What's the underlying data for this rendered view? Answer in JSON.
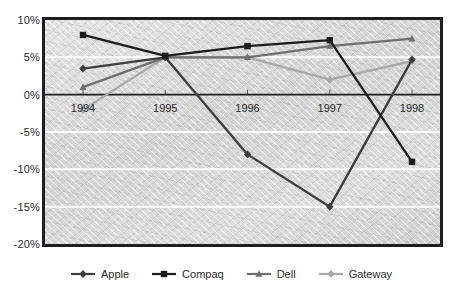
{
  "chart_data": {
    "type": "line",
    "title": "",
    "subtitle": "",
    "xlabel": "",
    "ylabel": "",
    "categories": [
      "1994",
      "1995",
      "1996",
      "1997",
      "1998"
    ],
    "ylim": [
      -20,
      10
    ],
    "ytick_labels": [
      "10%",
      "5%",
      "0%",
      "-5%",
      "-10%",
      "-15%",
      "-20%"
    ],
    "ytick_values": [
      10,
      5,
      0,
      -5,
      -10,
      -15,
      -20
    ],
    "grid": true,
    "legend_position": "bottom",
    "value_suffix": "%",
    "series": [
      {
        "name": "Apple",
        "color": "#3d3d3d",
        "marker": "diamond",
        "values": [
          3.5,
          5.0,
          -8.0,
          -15.0,
          4.7
        ]
      },
      {
        "name": "Compaq",
        "color": "#1c1c1c",
        "marker": "square",
        "values": [
          8.0,
          5.2,
          6.5,
          7.3,
          -9.0
        ]
      },
      {
        "name": "Dell",
        "color": "#6f6f6f",
        "marker": "triangle",
        "values": [
          1.0,
          5.0,
          5.0,
          6.5,
          7.5
        ]
      },
      {
        "name": "Gateway",
        "color": "#a8a8a8",
        "marker": "diamond",
        "values": [
          -2.0,
          5.0,
          5.0,
          2.0,
          4.5
        ]
      }
    ],
    "axis_line_value": 0,
    "axis_line_color": "#1e1e1e",
    "gridline_color": "#ffffff",
    "plot_background": "#dcdcdc",
    "frame_color": "#1e1e1e"
  }
}
